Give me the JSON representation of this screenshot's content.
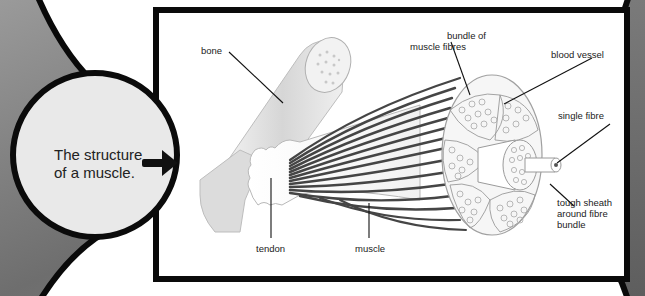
{
  "figure": {
    "caption": {
      "line1": "The structure",
      "line2": "of a muscle."
    },
    "labels": {
      "bone": "bone",
      "bundle_line1": "bundle of",
      "bundle_line2": "muscle fibres",
      "blood_vessel": "blood vessel",
      "single_fibre": "single fibre",
      "sheath_line1": "tough sheath",
      "sheath_line2": "around fibre",
      "sheath_line3": "bundle",
      "tendon": "tendon",
      "muscle": "muscle"
    },
    "icons": {
      "arrow": "arrow-right-icon"
    },
    "colors": {
      "frame_border": "#0a0a0a",
      "frame_fill": "#ffffff",
      "circle_fill": "#e9e9e9",
      "background": "#8a8a8a",
      "muscle_fibres": "#444444",
      "bone": "#e2e2e2"
    }
  }
}
